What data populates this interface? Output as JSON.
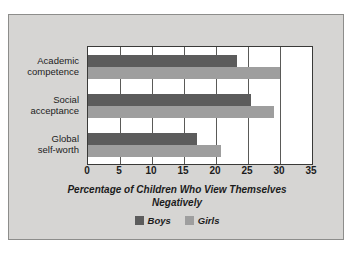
{
  "chart_data": {
    "type": "bar",
    "orientation": "horizontal",
    "title": "",
    "xlabel": "Percentage of Children Who View Themselves Negatively",
    "xlabel_lines": [
      "Percentage of Children Who View Themselves",
      "Negatively"
    ],
    "ylabel": "",
    "categories": [
      "Academic competence",
      "Social acceptance",
      "Global self-worth"
    ],
    "category_lines": [
      [
        "Academic",
        "competence"
      ],
      [
        "Social",
        "acceptance"
      ],
      [
        "Global",
        "self-worth"
      ]
    ],
    "series": [
      {
        "name": "Boys",
        "color": "#5c5c5c",
        "values": [
          23.3,
          25.5,
          17.0
        ]
      },
      {
        "name": "Girls",
        "color": "#9e9e9e",
        "values": [
          30.0,
          29.0,
          20.8
        ]
      }
    ],
    "xlim": [
      0,
      35
    ],
    "xticks": [
      0,
      5,
      10,
      15,
      20,
      25,
      30,
      35
    ],
    "xtick_labels": [
      "0",
      "5",
      "10",
      "15",
      "20",
      "25",
      "30",
      "35"
    ],
    "grid": true,
    "grid_axis": "x",
    "legend_position": "bottom-center",
    "plot_background": "#ffffff",
    "figure_background": "#d6d5d3",
    "axis_color": "#3a3a38"
  }
}
